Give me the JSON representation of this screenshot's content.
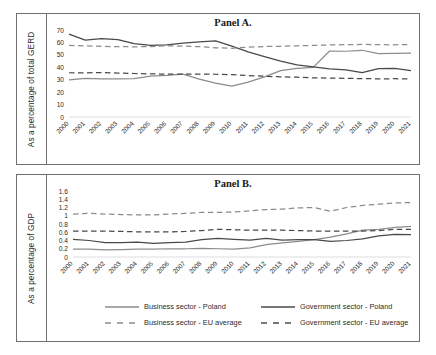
{
  "figure": {
    "panels": [
      {
        "id": "panel-a",
        "title": "Panel A.",
        "ylabel": "As a percentage of total GERD"
      },
      {
        "id": "panel-b",
        "title": "Panel B.",
        "ylabel": "As a percentage of GDP"
      }
    ],
    "legend": [
      {
        "label": "Business sector - Poland",
        "color": "#8c8c8c",
        "style": "solid"
      },
      {
        "label": "Government sector - Poland",
        "color": "#494949",
        "style": "solid"
      },
      {
        "label": "Business sector - EU average",
        "color": "#8c8c8c",
        "style": "dashed"
      },
      {
        "label": "Government sector - EU average",
        "color": "#494949",
        "style": "dashed"
      }
    ]
  },
  "chart_data": [
    {
      "type": "line",
      "title": "Panel A.",
      "xlabel": "",
      "ylabel": "As a percentage of total GERD",
      "ylim": [
        0,
        70
      ],
      "yticks": [
        0,
        10,
        20,
        30,
        40,
        50,
        60,
        70
      ],
      "grid": false,
      "legend_position": "bottom",
      "categories": [
        "2000",
        "2001",
        "2002",
        "2003",
        "2004",
        "2005",
        "2006",
        "2007",
        "2008",
        "2009",
        "2010",
        "2011",
        "2012",
        "2013",
        "2014",
        "2015",
        "2016",
        "2017",
        "2018",
        "2019",
        "2020",
        "2021"
      ],
      "series": [
        {
          "name": "Business sector - Poland",
          "color": "#8c8c8c",
          "style": "solid",
          "values": [
            29.8,
            31.0,
            30.6,
            30.7,
            30.8,
            32.8,
            33.5,
            34.5,
            30.5,
            27.3,
            24.9,
            28.1,
            32.3,
            37.3,
            39.2,
            39.9,
            53.1,
            52.9,
            53.7,
            51.0,
            51.2,
            51.3
          ]
        },
        {
          "name": "Government sector - Poland",
          "color": "#494949",
          "style": "solid",
          "values": [
            66.7,
            61.9,
            63.1,
            62.3,
            59.0,
            57.7,
            58.0,
            59.4,
            60.4,
            61.3,
            57.0,
            52.4,
            48.6,
            45.0,
            42.0,
            40.3,
            38.8,
            38.0,
            35.7,
            39.0,
            39.1,
            37.4
          ]
        },
        {
          "name": "Business sector - EU average",
          "color": "#8c8c8c",
          "style": "dashed",
          "values": [
            57.6,
            57.2,
            56.8,
            56.6,
            56.5,
            56.6,
            57.3,
            57.0,
            56.6,
            55.7,
            55.3,
            56.2,
            56.7,
            56.9,
            57.3,
            57.6,
            58.0,
            58.2,
            58.4,
            58.2,
            58.1,
            58.3
          ]
        },
        {
          "name": "Government sector - EU average",
          "color": "#494949",
          "style": "dashed",
          "values": [
            35.6,
            35.5,
            35.8,
            35.3,
            35.0,
            34.7,
            34.5,
            34.5,
            34.6,
            34.4,
            34.1,
            33.4,
            32.8,
            32.3,
            32.0,
            31.5,
            31.3,
            31.1,
            30.9,
            30.7,
            30.8,
            30.6
          ]
        }
      ]
    },
    {
      "type": "line",
      "title": "Panel B.",
      "xlabel": "",
      "ylabel": "As a percentage of GDP",
      "ylim": [
        0,
        1.6
      ],
      "yticks": [
        0,
        0.2,
        0.4,
        0.6,
        0.8,
        1,
        1.2,
        1.4,
        1.6
      ],
      "grid": false,
      "legend_position": "bottom",
      "categories": [
        "2000",
        "2001",
        "2002",
        "2003",
        "2004",
        "2005",
        "2006",
        "2007",
        "2008",
        "2009",
        "2010",
        "2011",
        "2012",
        "2013",
        "2014",
        "2015",
        "2016",
        "2017",
        "2018",
        "2019",
        "2020",
        "2021"
      ],
      "series": [
        {
          "name": "Business sector - Poland",
          "color": "#8c8c8c",
          "style": "solid",
          "values": [
            0.19,
            0.19,
            0.17,
            0.18,
            0.19,
            0.19,
            0.2,
            0.2,
            0.21,
            0.2,
            0.19,
            0.22,
            0.3,
            0.34,
            0.38,
            0.42,
            0.48,
            0.56,
            0.65,
            0.67,
            0.72,
            0.74
          ]
        },
        {
          "name": "Government sector - Poland",
          "color": "#494949",
          "style": "solid",
          "values": [
            0.43,
            0.4,
            0.35,
            0.35,
            0.36,
            0.33,
            0.35,
            0.36,
            0.42,
            0.45,
            0.43,
            0.41,
            0.45,
            0.41,
            0.42,
            0.42,
            0.38,
            0.4,
            0.44,
            0.51,
            0.55,
            0.54
          ]
        },
        {
          "name": "Business sector - EU average",
          "color": "#8c8c8c",
          "style": "dashed",
          "values": [
            1.04,
            1.06,
            1.04,
            1.03,
            1.02,
            1.02,
            1.04,
            1.06,
            1.08,
            1.08,
            1.09,
            1.12,
            1.15,
            1.16,
            1.19,
            1.2,
            1.11,
            1.2,
            1.25,
            1.28,
            1.31,
            1.32
          ]
        },
        {
          "name": "Government sector - EU average",
          "color": "#494949",
          "style": "dashed",
          "values": [
            0.63,
            0.63,
            0.63,
            0.62,
            0.61,
            0.61,
            0.61,
            0.62,
            0.64,
            0.67,
            0.66,
            0.65,
            0.65,
            0.65,
            0.64,
            0.63,
            0.63,
            0.63,
            0.63,
            0.64,
            0.67,
            0.67
          ]
        }
      ]
    }
  ]
}
